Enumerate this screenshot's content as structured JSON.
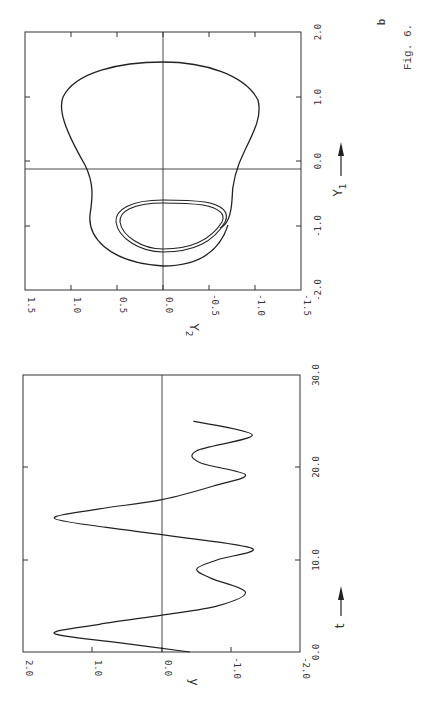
{
  "figure": {
    "caption": "Fig. 6.",
    "panel_label": "b"
  },
  "chart_data": [
    {
      "type": "line",
      "title": "",
      "panel": "b (phase portrait)",
      "xlabel": "Y1",
      "ylabel": "Y2",
      "xlim": [
        -2.0,
        2.0
      ],
      "ylim": [
        -1.5,
        1.5
      ],
      "xticks": [
        "-2.0",
        "-1.0",
        "0.0",
        "1.0",
        "2.0"
      ],
      "yticks": [
        "1.5",
        "1.0",
        "0.5",
        "0.0",
        "-0.5",
        "-1.0",
        "-1.5"
      ],
      "grid": false,
      "zero_lines": true,
      "series": [
        {
          "name": "limit cycle (outer)",
          "points_Y1_Y2": [
            [
              1.55,
              0.0
            ],
            [
              1.45,
              0.4
            ],
            [
              1.1,
              0.8
            ],
            [
              0.7,
              0.8
            ],
            [
              0.3,
              0.65
            ],
            [
              0.0,
              0.5
            ],
            [
              -0.4,
              0.45
            ],
            [
              -0.9,
              0.6
            ],
            [
              -1.2,
              0.5
            ],
            [
              -1.35,
              0.0
            ],
            [
              -1.2,
              -0.5
            ],
            [
              -0.9,
              -0.6
            ],
            [
              -0.4,
              -0.5
            ],
            [
              0.0,
              -0.5
            ],
            [
              0.3,
              -0.6
            ],
            [
              0.7,
              -0.8
            ],
            [
              1.1,
              -0.8
            ],
            [
              1.45,
              -0.4
            ],
            [
              1.55,
              0.0
            ]
          ]
        },
        {
          "name": "inner loop (double trace)",
          "points_Y1_Y2": [
            [
              -0.55,
              0.0
            ],
            [
              -0.7,
              0.45
            ],
            [
              -0.95,
              0.6
            ],
            [
              -1.15,
              0.5
            ],
            [
              -1.2,
              0.0
            ],
            [
              -1.15,
              -0.5
            ],
            [
              -0.95,
              -0.7
            ],
            [
              -0.8,
              -0.75
            ],
            [
              -0.55,
              0.0
            ]
          ]
        }
      ]
    },
    {
      "type": "line",
      "title": "",
      "panel": "time series",
      "xlabel": "t",
      "ylabel": "y",
      "xlim": [
        0.0,
        30.0
      ],
      "ylim": [
        -2.0,
        2.0
      ],
      "xticks": [
        "0.0",
        "10.0",
        "20.0",
        "30.0"
      ],
      "yticks": [
        "2.0",
        "1.0",
        "0.0",
        "-1.0",
        "-2.0"
      ],
      "grid": false,
      "zero_lines": true,
      "series": [
        {
          "name": "y(t)",
          "x": [
            0.0,
            1.0,
            2.0,
            3.0,
            4.0,
            5.0,
            6.5,
            8.0,
            9.0,
            10.0,
            11.2,
            12.5,
            13.5,
            14.5,
            15.5,
            16.5,
            18.0,
            19.2,
            20.5,
            21.8,
            23.5,
            25.0
          ],
          "y": [
            -0.4,
            0.6,
            1.55,
            0.9,
            0.0,
            -0.8,
            -1.2,
            -0.7,
            -0.5,
            -0.8,
            -1.3,
            -0.2,
            0.8,
            1.55,
            0.9,
            0.0,
            -0.75,
            -1.2,
            -0.55,
            -0.5,
            -1.3,
            -0.45
          ]
        }
      ]
    }
  ],
  "phase_plot": {
    "y1_label": "Y",
    "y1_sub": "1",
    "y2_label": "Y",
    "y2_sub": "2",
    "y1_ticks": [
      {
        "label": "2.0",
        "pos": 32
      },
      {
        "label": "1.0",
        "pos": 97
      },
      {
        "label": "0.0",
        "pos": 161
      },
      {
        "label": "-1.0",
        "pos": 226
      },
      {
        "label": "-2.0",
        "pos": 290
      }
    ],
    "y2_ticks": [
      {
        "label": "1.5",
        "pos": 25
      },
      {
        "label": "1.0",
        "pos": 71
      },
      {
        "label": "0.5",
        "pos": 117
      },
      {
        "label": "0.0",
        "pos": 163
      },
      {
        "label": "-0.5",
        "pos": 209
      },
      {
        "label": "-1.0",
        "pos": 255
      },
      {
        "label": "-1.5",
        "pos": 301
      }
    ]
  },
  "time_plot": {
    "y_label": "y",
    "t_label": "t",
    "t_ticks": [
      {
        "label": "0.0",
        "pos": 652
      },
      {
        "label": "10.0",
        "pos": 560
      },
      {
        "label": "20.0",
        "pos": 467
      },
      {
        "label": "30.0",
        "pos": 375
      }
    ],
    "y_ticks": [
      {
        "label": "2.0",
        "pos": 23
      },
      {
        "label": "1.0",
        "pos": 92
      },
      {
        "label": "0.0",
        "pos": 162
      },
      {
        "label": "-1.0",
        "pos": 231
      },
      {
        "label": "-2.0",
        "pos": 300
      }
    ]
  }
}
